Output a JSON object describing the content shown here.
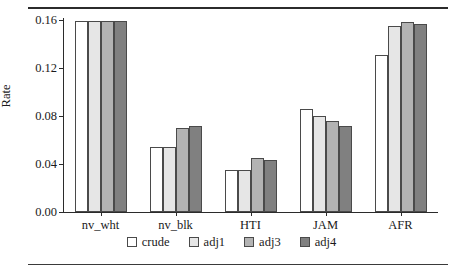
{
  "chart_data": {
    "type": "bar",
    "title": "",
    "xlabel": "",
    "ylabel": "Rate",
    "categories": [
      "nv_wht",
      "nv_blk",
      "HTI",
      "JAM",
      "AFR"
    ],
    "series": [
      {
        "name": "crude",
        "color": "#ffffff",
        "values": [
          0.159,
          0.054,
          0.035,
          0.086,
          0.131
        ]
      },
      {
        "name": "adj1",
        "color": "#e6e6e6",
        "values": [
          0.159,
          0.054,
          0.035,
          0.08,
          0.155
        ]
      },
      {
        "name": "adj3",
        "color": "#b3b3b3",
        "values": [
          0.159,
          0.07,
          0.045,
          0.076,
          0.158
        ]
      },
      {
        "name": "adj4",
        "color": "#808080",
        "values": [
          0.159,
          0.072,
          0.043,
          0.072,
          0.157
        ]
      }
    ],
    "ylim": [
      0.0,
      0.16
    ],
    "yticks": [
      0.0,
      0.04,
      0.08,
      0.12,
      0.16
    ],
    "ytick_labels": [
      "0.00",
      "0.04",
      "0.08",
      "0.12",
      "0.16"
    ],
    "grid": false,
    "legend_position": "bottom"
  },
  "legend": {
    "entries": [
      {
        "label": "crude"
      },
      {
        "label": "adj1"
      },
      {
        "label": "adj3"
      },
      {
        "label": "adj4"
      }
    ]
  },
  "rules": {
    "top": "horizontal-rule",
    "bottom": "horizontal-rule"
  }
}
